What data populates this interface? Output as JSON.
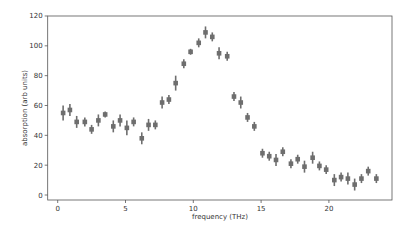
{
  "chart_data": {
    "type": "scatter",
    "title": "",
    "xlabel": "frequency (THz)",
    "ylabel": "absorption (arb units)",
    "xlim": [
      -1.2,
      24.4
    ],
    "ylim": [
      -3.4,
      120
    ],
    "xticks": [
      0,
      5,
      10,
      15,
      20
    ],
    "yticks": [
      0,
      20,
      40,
      60,
      80,
      100,
      120
    ],
    "grid": false,
    "legend": null,
    "marker": "square with vertical error bars",
    "color": "#6e6e6e",
    "series": [
      {
        "name": "absorption",
        "x": [
          0.4,
          0.9,
          1.4,
          2.0,
          2.5,
          3.0,
          3.5,
          4.1,
          4.6,
          5.1,
          5.6,
          6.2,
          6.7,
          7.2,
          7.7,
          8.2,
          8.7,
          9.3,
          9.8,
          10.4,
          10.9,
          11.4,
          11.9,
          12.5,
          13.0,
          13.5,
          14.0,
          14.5,
          15.1,
          15.6,
          16.1,
          16.6,
          17.2,
          17.7,
          18.2,
          18.8,
          19.3,
          19.8,
          20.4,
          20.9,
          21.4,
          21.9,
          22.4,
          22.9,
          23.5
        ],
        "y": [
          55,
          57,
          49,
          49,
          44,
          50,
          54,
          46,
          50,
          45,
          49,
          38,
          47,
          47,
          62,
          64,
          75,
          88,
          96,
          102,
          109,
          106,
          95,
          93,
          66,
          62,
          52,
          46,
          28,
          26,
          23.5,
          29,
          21,
          24,
          19,
          25,
          19.5,
          17,
          10,
          12,
          11,
          7,
          11,
          16,
          11
        ],
        "yerr": [
          5,
          4,
          4,
          3,
          3,
          4,
          2,
          4,
          4,
          5,
          3,
          4,
          4,
          3,
          4,
          3,
          5,
          3,
          2,
          3,
          4,
          3,
          4,
          3,
          3,
          4,
          3,
          3,
          3,
          3,
          4,
          3,
          3,
          3,
          4,
          4,
          3,
          3,
          4,
          3,
          4,
          4,
          3,
          3,
          3
        ]
      }
    ]
  }
}
